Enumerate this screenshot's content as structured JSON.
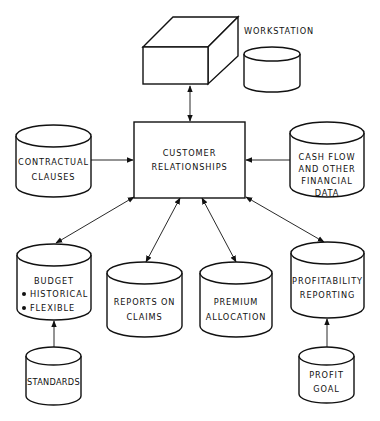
{
  "diagram": {
    "type": "data-flow",
    "colors": {
      "stroke": "#111111",
      "background": "#ffffff"
    },
    "center": {
      "id": "customer",
      "lines": [
        "CUSTOMER",
        "RELATIONSHIPS"
      ]
    },
    "workstation": {
      "label": "WORKSTATION"
    },
    "nodes": {
      "contractual": {
        "lines": [
          "CONTRACTUAL",
          "CLAUSES"
        ]
      },
      "cashflow": {
        "lines": [
          "CASH FLOW",
          "AND OTHER",
          "FINANCIAL",
          "DATA"
        ]
      },
      "budget": {
        "lines": [
          "BUDGET",
          "HISTORICAL",
          "FLEXIBLE"
        ],
        "bullets": [
          "HISTORICAL",
          "FLEXIBLE"
        ]
      },
      "reports": {
        "lines": [
          "REPORTS ON",
          "CLAIMS"
        ]
      },
      "premium": {
        "lines": [
          "PREMIUM",
          "ALLOCATION"
        ]
      },
      "profitability": {
        "lines": [
          "PROFITABILITY",
          "REPORTING"
        ]
      },
      "standards": {
        "lines": [
          "STANDARDS"
        ]
      },
      "profitgoal": {
        "lines": [
          "PROFIT",
          "GOAL"
        ]
      }
    },
    "edges": [
      {
        "from": "workstation",
        "to": "customer",
        "direction": "both"
      },
      {
        "from": "contractual",
        "to": "customer",
        "direction": "forward"
      },
      {
        "from": "cashflow",
        "to": "customer",
        "direction": "forward"
      },
      {
        "from": "budget",
        "to": "customer",
        "direction": "both"
      },
      {
        "from": "reports",
        "to": "customer",
        "direction": "both"
      },
      {
        "from": "premium",
        "to": "customer",
        "direction": "both"
      },
      {
        "from": "profitability",
        "to": "customer",
        "direction": "both"
      },
      {
        "from": "standards",
        "to": "budget",
        "direction": "forward"
      },
      {
        "from": "profitgoal",
        "to": "profitability",
        "direction": "forward"
      }
    ]
  }
}
